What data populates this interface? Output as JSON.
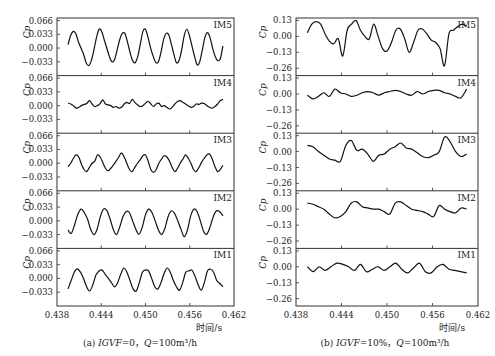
{
  "chart_data": [
    {
      "type": "line",
      "id": "a",
      "caption_prefix": "(a) ",
      "caption_igvf": "IGVF",
      "caption_rest": "=0，",
      "caption_q": "Q",
      "caption_tail": "=100m³/h",
      "xlabel": "时间/s",
      "ylabel": "Cp",
      "xlim": [
        0.438,
        0.462
      ],
      "xticks": [
        0.438,
        0.444,
        0.45,
        0.456,
        0.462
      ],
      "xtick_labels": [
        "0.438",
        "0.444",
        "0.450",
        "0.456",
        "0.462"
      ],
      "ylim": [
        -0.066,
        0.072
      ],
      "yticks": [
        0.066,
        0.033,
        0.0,
        -0.033
      ],
      "ytick_labels": [
        "0.066",
        "0.033",
        "0.000",
        "−0.033"
      ],
      "panels": [
        {
          "name": "IM5",
          "t0": 0.4395,
          "t1": 0.4605,
          "values": [
            0.008,
            0.03,
            0.04,
            0.035,
            0.015,
            0.0,
            -0.015,
            -0.035,
            -0.042,
            -0.03,
            -0.005,
            0.025,
            0.045,
            0.04,
            0.02,
            0.0,
            -0.02,
            -0.033,
            -0.028,
            -0.005,
            0.02,
            0.035,
            0.035,
            0.015,
            -0.01,
            -0.03,
            -0.035,
            -0.02,
            0.01,
            0.04,
            0.045,
            0.025,
            0.0,
            -0.02,
            -0.035,
            -0.033,
            -0.01,
            0.02,
            0.035,
            0.032,
            0.01,
            -0.015,
            -0.035,
            -0.03,
            -0.005,
            0.03,
            0.045,
            0.03,
            0.005,
            -0.02,
            -0.04,
            -0.033,
            -0.005,
            0.025,
            0.037,
            0.025,
            0.0,
            -0.02,
            -0.03,
            -0.025,
            0.005
          ]
        },
        {
          "name": "IM4",
          "t0": 0.4395,
          "t1": 0.4605,
          "values": [
            0.006,
            0.004,
            0.0,
            -0.006,
            -0.004,
            0.0,
            0.003,
            0.005,
            0.012,
            0.004,
            -0.002,
            0.0,
            0.005,
            0.014,
            0.004,
            0.002,
            0.0,
            -0.004,
            -0.002,
            -0.006,
            -0.004,
            0.004,
            0.008,
            0.005,
            0.015,
            0.008,
            0.002,
            -0.002,
            0.0,
            0.006,
            0.01,
            0.004,
            -0.002,
            0.004,
            0.006,
            -0.002,
            0.0,
            -0.004,
            -0.008,
            -0.004,
            0.004,
            0.01,
            0.012,
            0.008,
            0.004,
            0.0,
            -0.004,
            -0.002,
            0.004,
            0.003,
            0.006,
            0.005,
            0.0,
            -0.004,
            -0.006,
            -0.002,
            0.004,
            0.012,
            0.015
          ]
        },
        {
          "name": "IM3",
          "t0": 0.4395,
          "t1": 0.4605,
          "values": [
            -0.008,
            0.0,
            0.012,
            0.02,
            0.015,
            -0.002,
            -0.015,
            -0.02,
            -0.01,
            0.0,
            0.005,
            0.02,
            0.015,
            0.002,
            -0.012,
            -0.018,
            -0.012,
            -0.004,
            0.005,
            0.015,
            0.025,
            0.015,
            0.0,
            -0.015,
            -0.02,
            -0.01,
            0.0,
            0.008,
            0.018,
            0.02,
            0.005,
            -0.015,
            -0.022,
            -0.015,
            0.0,
            0.01,
            0.018,
            0.015,
            0.005,
            -0.01,
            -0.02,
            -0.012,
            0.0,
            0.01,
            0.02,
            0.012,
            0.0,
            -0.015,
            -0.02,
            -0.01,
            0.002,
            0.012,
            0.02,
            0.022,
            0.01,
            -0.008,
            -0.02,
            -0.015,
            -0.005
          ]
        },
        {
          "name": "IM2",
          "t0": 0.4395,
          "t1": 0.4605,
          "values": [
            -0.022,
            -0.03,
            -0.01,
            0.015,
            0.028,
            0.02,
            0.005,
            -0.02,
            -0.033,
            -0.02,
            0.01,
            0.028,
            0.025,
            0.005,
            -0.02,
            -0.033,
            -0.015,
            0.01,
            0.022,
            0.02,
            0.0,
            -0.02,
            -0.032,
            -0.015,
            0.015,
            0.028,
            0.02,
            0.0,
            -0.022,
            -0.033,
            -0.018,
            0.01,
            0.024,
            0.018,
            0.0,
            -0.02,
            -0.038,
            -0.022,
            0.012,
            0.028,
            0.022,
            0.0,
            -0.025,
            -0.032,
            -0.015,
            0.01,
            0.024,
            0.022,
            0.012
          ]
        },
        {
          "name": "IM1",
          "t0": 0.4395,
          "t1": 0.4605,
          "values": [
            -0.025,
            -0.005,
            0.015,
            0.023,
            0.015,
            0.0,
            -0.02,
            -0.03,
            -0.015,
            0.008,
            0.018,
            0.02,
            0.01,
            0.0,
            -0.01,
            -0.02,
            -0.01,
            0.01,
            0.025,
            0.015,
            -0.005,
            -0.025,
            -0.03,
            -0.01,
            0.015,
            0.02,
            0.018,
            0.0,
            -0.02,
            -0.025,
            -0.01,
            0.012,
            0.025,
            0.015,
            -0.005,
            -0.02,
            -0.028,
            -0.01,
            0.015,
            0.018,
            0.02,
            0.005,
            -0.015,
            -0.028,
            -0.01,
            0.018,
            0.022,
            0.015,
            -0.005,
            -0.012,
            -0.02
          ]
        }
      ]
    },
    {
      "type": "line",
      "id": "b",
      "caption_prefix": "(b) ",
      "caption_igvf": "IGVF",
      "caption_rest": "=10%，",
      "caption_q": "Q",
      "caption_tail": "=100m³/h",
      "xlabel": "时间/s",
      "ylabel": "Cp",
      "xlim": [
        0.438,
        0.462
      ],
      "xticks": [
        0.438,
        0.444,
        0.45,
        0.456,
        0.462
      ],
      "xtick_labels": [
        "0.438",
        "0.444",
        "0.450",
        "0.456",
        "0.462"
      ],
      "ylim": [
        -0.32,
        0.15
      ],
      "yticks": [
        0.13,
        0.0,
        -0.13,
        -0.26
      ],
      "ytick_labels": [
        "0.13",
        "0.00",
        "−0.13",
        "−0.26"
      ],
      "panels": [
        {
          "name": "IM5",
          "t0": 0.4395,
          "t1": 0.4605,
          "values": [
            0.03,
            0.1,
            0.12,
            0.1,
            0.02,
            -0.04,
            -0.06,
            -0.02,
            -0.16,
            0.05,
            0.1,
            0.13,
            0.05,
            0.0,
            -0.02,
            0.1,
            0.0,
            -0.1,
            -0.12,
            -0.05,
            0.05,
            0.06,
            -0.02,
            -0.13,
            -0.05,
            0.05,
            0.06,
            0.02,
            -0.03,
            -0.05,
            -0.1,
            -0.24,
            0.02,
            0.05,
            0.08,
            0.1,
            0.08
          ]
        },
        {
          "name": "IM4",
          "t0": 0.4395,
          "t1": 0.4605,
          "values": [
            -0.01,
            -0.04,
            -0.02,
            0.01,
            -0.02,
            0.04,
            0.01,
            0.0,
            -0.02,
            -0.01,
            0.01,
            0.02,
            0.01,
            -0.01,
            0.01,
            0.02,
            0.03,
            0.02,
            0.0,
            -0.01,
            0.02,
            0.0,
            0.02,
            0.03,
            0.03,
            0.01,
            0.0,
            -0.02,
            -0.03,
            0.04
          ]
        },
        {
          "name": "IM3",
          "t0": 0.4395,
          "t1": 0.4605,
          "values": [
            0.05,
            0.04,
            0.0,
            -0.03,
            -0.06,
            -0.07,
            -0.08,
            0.05,
            0.09,
            0.01,
            0.02,
            -0.02,
            -0.08,
            -0.03,
            -0.02,
            0.02,
            0.04,
            0.07,
            0.03,
            0.02,
            -0.01,
            -0.04,
            -0.05,
            -0.03,
            0.0,
            0.12,
            0.08,
            0.0,
            -0.04,
            -0.02
          ]
        },
        {
          "name": "IM2",
          "t0": 0.4395,
          "t1": 0.4605,
          "values": [
            0.05,
            0.04,
            0.02,
            0.0,
            -0.04,
            -0.07,
            -0.06,
            -0.02,
            0.05,
            0.06,
            0.02,
            0.01,
            0.0,
            0.0,
            -0.02,
            -0.04,
            0.05,
            0.06,
            0.03,
            0.0,
            -0.01,
            -0.02,
            -0.04,
            -0.06,
            0.03,
            0.0,
            -0.02,
            -0.03,
            0.01,
            0.0
          ]
        },
        {
          "name": "IM1",
          "t0": 0.4395,
          "t1": 0.4605,
          "values": [
            0.0,
            -0.04,
            0.0,
            -0.03,
            0.0,
            0.03,
            0.02,
            0.0,
            -0.03,
            0.02,
            -0.04,
            -0.02,
            0.0,
            -0.03,
            0.0,
            0.03,
            -0.02,
            -0.05,
            -0.01,
            0.03,
            -0.04,
            -0.05,
            0.0,
            0.02,
            -0.02,
            -0.03,
            -0.04,
            -0.05
          ]
        }
      ]
    }
  ]
}
